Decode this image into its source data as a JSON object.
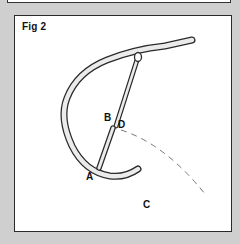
{
  "figure": {
    "title": "Fig 2",
    "labels": {
      "a": "A",
      "b": "B",
      "c": "C",
      "d": "D"
    }
  },
  "colors": {
    "background": "#cfcfcf",
    "panel": "#ffffff",
    "stroke": "#2a2a2a",
    "fill": "#e8e8e8",
    "dashed": "#777777"
  }
}
